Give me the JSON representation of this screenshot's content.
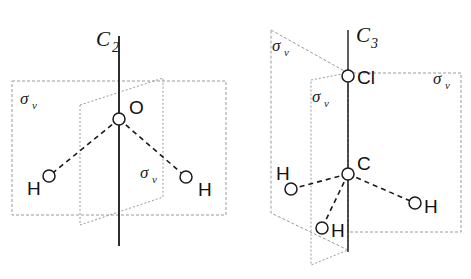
{
  "figure": {
    "background_color": "#ffffff",
    "line_color": "#1a1a1a",
    "plane_color": "#9a9a9a"
  },
  "molecules": [
    {
      "id": "water",
      "name": "water",
      "formula": "H2O",
      "axis": {
        "name": "principal-axis",
        "label_main": "C",
        "label_sub": "2",
        "label_x": 96,
        "label_y": 46,
        "sub_x": 112,
        "sub_y": 52,
        "x1": 119,
        "y1": 36,
        "x2": 119,
        "y2": 246
      },
      "atoms": [
        {
          "name": "oxygen",
          "symbol": "O",
          "cx": 119,
          "cy": 119,
          "r": 6,
          "label_x": 129,
          "label_y": 114
        },
        {
          "name": "hydrogen-left",
          "symbol": "H",
          "cx": 49,
          "cy": 176,
          "r": 6,
          "label_x": 27,
          "label_y": 195
        },
        {
          "name": "hydrogen-right",
          "symbol": "H",
          "cx": 186,
          "cy": 177,
          "r": 6,
          "label_x": 198,
          "label_y": 196
        }
      ],
      "bonds": [
        {
          "name": "bond-o-h-left",
          "x1": 119,
          "y1": 119,
          "x2": 49,
          "y2": 176
        },
        {
          "name": "bond-o-h-right",
          "x1": 119,
          "y1": 119,
          "x2": 186,
          "y2": 177
        }
      ],
      "planes": [
        {
          "name": "mirror-plane-molecular",
          "label": "σ",
          "label_sub": "v",
          "label_x": 20,
          "label_y": 104,
          "sub_x": 32,
          "sub_y": 109,
          "points": "12,81 226,81 226,215 12,215"
        },
        {
          "name": "mirror-plane-perpendicular",
          "label": "σ",
          "label_sub": "v",
          "label_x": 140,
          "label_y": 178,
          "sub_x": 152,
          "sub_y": 183,
          "points": "80,105 163,78 163,197 80,225"
        }
      ]
    },
    {
      "id": "chloromethane",
      "name": "chloromethane",
      "formula": "CH3Cl",
      "axis": {
        "name": "principal-axis",
        "label_main": "C",
        "label_sub": "3",
        "label_x": 356,
        "label_y": 42,
        "sub_x": 371,
        "sub_y": 48,
        "x1": 348,
        "y1": 30,
        "x2": 348,
        "y2": 252
      },
      "atoms": [
        {
          "name": "chlorine",
          "symbol": "Cl",
          "cx": 348,
          "cy": 76,
          "r": 6,
          "label_x": 357,
          "label_y": 84
        },
        {
          "name": "carbon",
          "symbol": "C",
          "cx": 348,
          "cy": 174,
          "r": 6,
          "label_x": 357,
          "label_y": 170
        },
        {
          "name": "hydrogen-left",
          "symbol": "H",
          "cx": 291,
          "cy": 189,
          "r": 6,
          "label_x": 276,
          "label_y": 180
        },
        {
          "name": "hydrogen-front",
          "symbol": "H",
          "cx": 322,
          "cy": 228,
          "r": 6,
          "label_x": 331,
          "label_y": 237
        },
        {
          "name": "hydrogen-right",
          "symbol": "H",
          "cx": 415,
          "cy": 203,
          "r": 6,
          "label_x": 424,
          "label_y": 213
        }
      ],
      "bonds": [
        {
          "name": "bond-c-cl",
          "x1": 348,
          "y1": 174,
          "x2": 348,
          "y2": 76
        },
        {
          "name": "bond-c-h-left",
          "x1": 348,
          "y1": 174,
          "x2": 291,
          "y2": 189
        },
        {
          "name": "bond-c-h-front",
          "x1": 348,
          "y1": 174,
          "x2": 322,
          "y2": 228
        },
        {
          "name": "bond-c-h-right",
          "x1": 348,
          "y1": 174,
          "x2": 415,
          "y2": 203
        }
      ],
      "planes": [
        {
          "name": "mirror-plane-back-left",
          "label": "σ",
          "label_sub": "v",
          "label_x": 272,
          "label_y": 51,
          "sub_x": 284,
          "sub_y": 56,
          "points": "271,30 348,73 348,250 271,213"
        },
        {
          "name": "mirror-plane-front-left",
          "label": "σ",
          "label_sub": "v",
          "label_x": 312,
          "label_y": 102,
          "sub_x": 324,
          "sub_y": 107,
          "points": "311,80 348,73 348,250 311,265"
        },
        {
          "name": "mirror-plane-right",
          "label": "σ",
          "label_sub": "v",
          "label_x": 433,
          "label_y": 84,
          "sub_x": 445,
          "sub_y": 89,
          "points": "348,73 461,73 461,232 348,232"
        }
      ]
    }
  ]
}
